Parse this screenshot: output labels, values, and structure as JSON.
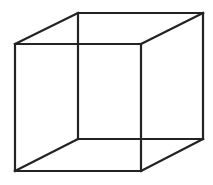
{
  "figure": {
    "background": "#ffffff",
    "line_color": "#232323",
    "stroke_width": 2.2
  },
  "vertices": {
    "front_top_left": [
      15,
      44
    ],
    "front_top_right": [
      141,
      44
    ],
    "front_bottom_right": [
      141,
      171
    ],
    "front_bottom_left": [
      15,
      171
    ],
    "back_top_left": [
      78,
      13
    ],
    "back_top_right": [
      203,
      13
    ],
    "back_bottom_right": [
      203,
      139
    ],
    "back_bottom_left": [
      78,
      139
    ]
  },
  "edges": [
    {
      "name": "front-top",
      "from": "front_top_left",
      "to": "front_top_right"
    },
    {
      "name": "front-right",
      "from": "front_top_right",
      "to": "front_bottom_right"
    },
    {
      "name": "front-bottom",
      "from": "front_bottom_right",
      "to": "front_bottom_left"
    },
    {
      "name": "front-left",
      "from": "front_bottom_left",
      "to": "front_top_left"
    },
    {
      "name": "back-top",
      "from": "back_top_left",
      "to": "back_top_right"
    },
    {
      "name": "back-right",
      "from": "back_top_right",
      "to": "back_bottom_right"
    },
    {
      "name": "back-bottom",
      "from": "back_bottom_right",
      "to": "back_bottom_left"
    },
    {
      "name": "back-left",
      "from": "back_bottom_left",
      "to": "back_top_left"
    },
    {
      "name": "connector-top-left",
      "from": "front_top_left",
      "to": "back_top_left"
    },
    {
      "name": "connector-top-right",
      "from": "front_top_right",
      "to": "back_top_right"
    },
    {
      "name": "connector-bottom-right",
      "from": "front_bottom_right",
      "to": "back_bottom_right"
    },
    {
      "name": "connector-bottom-left",
      "from": "front_bottom_left",
      "to": "back_bottom_left"
    }
  ]
}
